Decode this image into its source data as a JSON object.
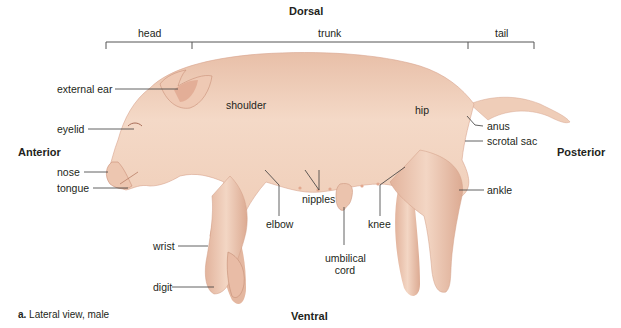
{
  "figure": {
    "orientation": {
      "dorsal": "Dorsal",
      "ventral": "Ventral",
      "anterior": "Anterior",
      "posterior": "Posterior"
    },
    "regions": {
      "head": "head",
      "trunk": "trunk",
      "tail": "tail"
    },
    "labels": {
      "external_ear": "external ear",
      "eyelid": "eyelid",
      "nose": "nose",
      "tongue": "tongue",
      "shoulder": "shoulder",
      "hip": "hip",
      "anus": "anus",
      "scrotal_sac": "scrotal sac",
      "ankle": "ankle",
      "elbow": "elbow",
      "nipples": "nipples",
      "umbilical_cord_line1": "umbilical",
      "umbilical_cord_line2": "cord",
      "knee": "knee",
      "wrist": "wrist",
      "digit": "digit"
    },
    "caption": {
      "letter": "a.",
      "text": " Lateral view, male"
    },
    "colors": {
      "skin": "#f2d3c0",
      "skin_shadow": "#d9a58e",
      "skin_highlight": "#f8e4d6",
      "leader_line": "#3a3a3a",
      "bracket": "#555555"
    }
  }
}
